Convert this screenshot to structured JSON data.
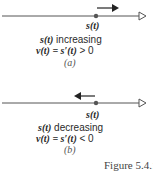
{
  "panel_a": {
    "point_label": "s(t)",
    "line1_fn": "s(t)",
    "line1_word": " increasing",
    "line2_lhs": "v(t) = s′(t)",
    "line2_rel": " > 0",
    "caption": "(a)",
    "motion_direction": "right"
  },
  "panel_b": {
    "point_label": "s(t)",
    "line1_fn": "s(t)",
    "line1_word": " decreasing",
    "line2_lhs": "v(t) = s′(t)",
    "line2_rel": " < 0",
    "caption": "(b)",
    "motion_direction": "left"
  },
  "figure_label": "Figure 5.4.1",
  "colors": {
    "ink": "#2a2a2a",
    "line": "#555555"
  }
}
